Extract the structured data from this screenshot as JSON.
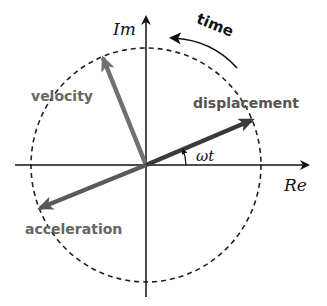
{
  "diagram": {
    "axes": {
      "real_label": "Re",
      "imag_label": "Im"
    },
    "circle": {
      "style": "dashed"
    },
    "time_label": "time",
    "angle_label": "ωt",
    "phasors": [
      {
        "name": "displacement",
        "label": "displacement",
        "color": "#3a3a3a",
        "angle_deg": 23
      },
      {
        "name": "velocity",
        "label": "velocity",
        "color": "#707070",
        "angle_deg": 113
      },
      {
        "name": "acceleration",
        "label": "acceleration",
        "color": "#5a5a5a",
        "angle_deg": 203
      }
    ],
    "colors": {
      "axis": "#111111",
      "circle": "#222222",
      "label_gray": "#666666",
      "text_dark": "#111111"
    }
  }
}
